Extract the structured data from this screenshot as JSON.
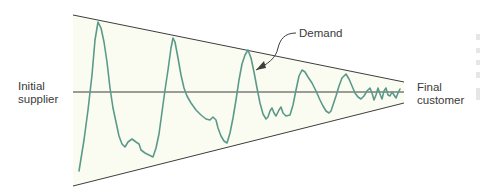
{
  "diagram": {
    "labels": {
      "left_line1": "Initial",
      "left_line2": "supplier",
      "right_line1": "Final",
      "right_line2": "customer",
      "demand": "Demand"
    },
    "colors": {
      "funnel_fill": "#fbfcf1",
      "funnel_lines": "#3d3d3d",
      "demand_curve": "#5b9a8b",
      "label_text": "#3a3a3a"
    },
    "funnel": {
      "upper_line": [
        [
          73,
          15
        ],
        [
          404,
          82
        ]
      ],
      "lower_line": [
        [
          73,
          186
        ],
        [
          404,
          103
        ]
      ],
      "center_line": [
        [
          73,
          92
        ],
        [
          404,
          92
        ]
      ]
    },
    "demand_curve_points": "79,171 84,140 88,110 92,75 95,40 98,22 101,28 104,42 107,62 110,88 113,108 116,122 119,136 122,144 125,147 128,142 132,139 136,142 139,144 141,150 145,153 149,155 153,157 156,148 159,134 162,112 165,90 168,70 171,48 173,38 175,42 178,58 181,75 184,88 187,96 191,103 196,110 201,115 206,119 210,120 213,117 216,120 218,128 221,136 224,141 227,143 230,133 233,118 236,100 239,80 242,64 245,55 248,50 251,58 254,72 257,88 260,103 263,114 266,119 268,117 270,111 272,108 274,113 276,116 279,110 281,107 283,113 286,116 290,115 293,105 296,90 299,76 302,70 305,72 308,77 312,83 316,91 320,100 323,106 326,111 329,113 331,111 333,105 336,96 339,86 342,78 346,74 349,79 352,86 355,93 358,97 361,99 364,96 367,91 370,88 372,93 374,100 376,95 378,88 380,94 382,99 384,91 386,88 388,95 390,96 392,92 394,95 396,98 398,93 400,89",
    "demand_arrow": {
      "path": "M 296 33 C 284 33, 280 40, 278 48 C 276 58, 268 64, 256 70",
      "head": "256,70 264,61 266,68"
    }
  }
}
